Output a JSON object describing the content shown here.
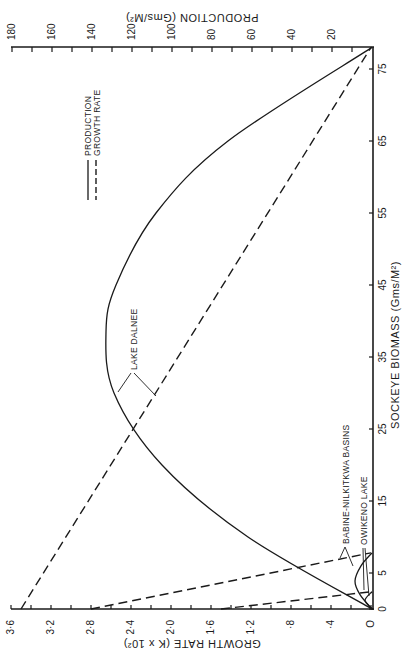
{
  "chart_data": {
    "type": "line",
    "orientation": "rotated-90-ccw",
    "title": "",
    "xlabel": "SOCKEYE BIOMASS (Gms/M²)",
    "ylabel_left": "GROWTH RATE (K x 10²)",
    "ylabel_right": "PRODUCTION (Gms/M²)",
    "x_ticks": [
      "0",
      "5",
      "15",
      "25",
      "35",
      "45",
      "55",
      "65",
      "75"
    ],
    "x_tick_values": [
      0,
      5,
      15,
      25,
      35,
      45,
      55,
      65,
      75
    ],
    "xlim": [
      0,
      78
    ],
    "growth_ticks": [
      "O",
      "·4",
      "·8",
      "1·2",
      "1·6",
      "2·0",
      "2·4",
      "2·8",
      "3·2",
      "3·6"
    ],
    "growth_tick_values": [
      0,
      0.4,
      0.8,
      1.2,
      1.6,
      2.0,
      2.4,
      2.8,
      3.2,
      3.6
    ],
    "growth_lim": [
      0,
      3.6
    ],
    "production_ticks": [
      "20",
      "40",
      "60",
      "80",
      "100",
      "120",
      "140",
      "160",
      "180"
    ],
    "production_tick_values": [
      20,
      40,
      60,
      80,
      100,
      120,
      140,
      160,
      180
    ],
    "production_lim": [
      0,
      180
    ],
    "legend": [
      {
        "label": "PRODUCTION",
        "style": "solid"
      },
      {
        "label": "GROWTH RATE",
        "style": "dashed"
      }
    ],
    "series": [
      {
        "name": "Lake Dalnee growth rate",
        "style": "dashed",
        "axis": "growth",
        "x": [
          0,
          78
        ],
        "values": [
          3.5,
          0
        ]
      },
      {
        "name": "Babine-Nilkitkwa Basins growth rate",
        "style": "dashed",
        "axis": "growth",
        "x": [
          0,
          7.8
        ],
        "values": [
          2.8,
          0
        ]
      },
      {
        "name": "Owikeno Lake growth rate",
        "style": "dashed",
        "axis": "growth",
        "x": [
          0,
          2.4
        ],
        "values": [
          1.5,
          0
        ]
      },
      {
        "name": "Lake Dalnee production",
        "style": "solid",
        "axis": "production",
        "x": [
          0,
          10,
          20,
          30,
          38.5,
          45,
          55,
          65,
          78
        ],
        "values": [
          0,
          62,
          105,
          129,
          133,
          128,
          108,
          72,
          0
        ]
      },
      {
        "name": "Babine-Nilkitkwa Basins production",
        "style": "solid",
        "axis": "production",
        "x": [
          0,
          2,
          3.9,
          6,
          7.8
        ],
        "values": [
          0,
          6,
          8.5,
          5.5,
          0
        ]
      },
      {
        "name": "Owikeno Lake production",
        "style": "solid",
        "axis": "production",
        "x": [
          0,
          1.2,
          2.4
        ],
        "values": [
          0,
          3.5,
          0
        ]
      }
    ],
    "annotations": [
      "LAKE DALNEE",
      "BABINE-NILKITKWA BASINS",
      "OWIKENO LAKE"
    ],
    "grid": false,
    "legend_position": "upper-left (rotated)"
  },
  "labels": {
    "legend_production": "PRODUCTION",
    "legend_growth": "GROWTH RATE",
    "ann_dalnee": "LAKE DALNEE",
    "ann_babine": "BABINE-NILKITKWA BASINS",
    "ann_owikeno": "OWIKENO LAKE",
    "axis_biomass": "SOCKEYE BIOMASS (Gms/M²)",
    "axis_growth": "GROWTH RATE (K x 10²)",
    "axis_production": "PRODUCTION (Gms/M²)"
  }
}
